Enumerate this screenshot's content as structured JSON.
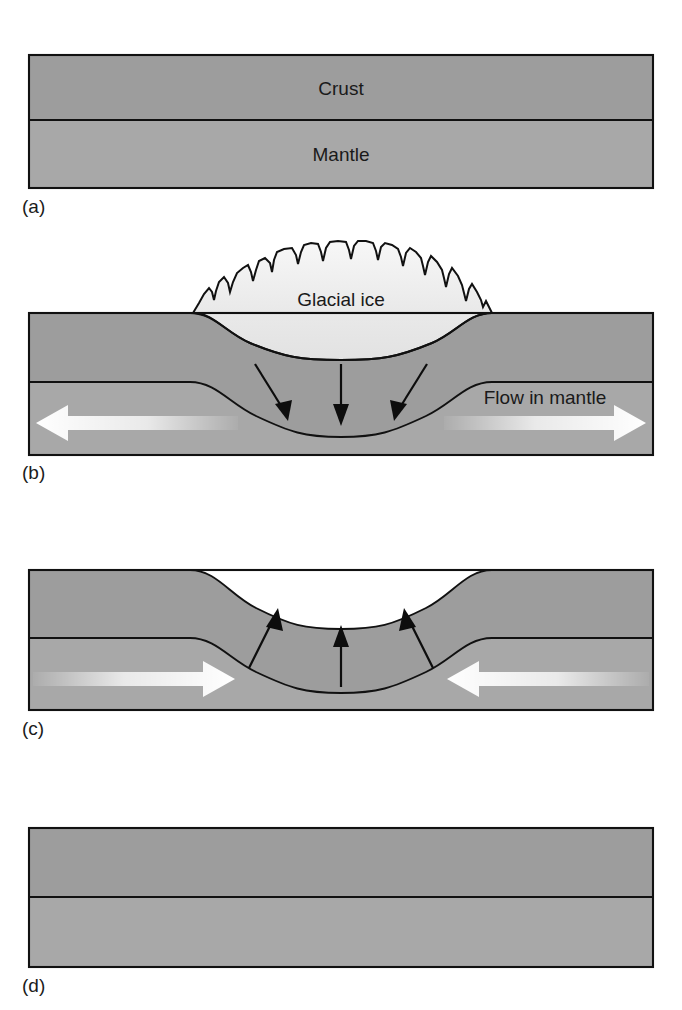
{
  "figure": {
    "background_color": "#ffffff",
    "width": 682,
    "height": 1010
  },
  "colors": {
    "crust_fill": "#9d9d9d",
    "mantle_fill": "#a8a8a8",
    "ice_fill": "#ececec",
    "outline": "#111111",
    "text": "#1a1a1a",
    "white_arrow": "#ffffff"
  },
  "panels": [
    {
      "id": "a",
      "label": "(a)",
      "caption_state": "undisturbed crust and mantle, flat layers",
      "layers": [
        {
          "name": "crust",
          "label": "Crust"
        },
        {
          "name": "mantle",
          "label": "Mantle"
        }
      ],
      "ice_present": false,
      "arrows": []
    },
    {
      "id": "b",
      "label": "(b)",
      "caption_state": "ice sheet loads the crust, crust depresses, mantle flows outward",
      "layers": [
        {
          "name": "crust",
          "label": ""
        },
        {
          "name": "mantle",
          "label": ""
        }
      ],
      "ice_present": true,
      "ice_label": "Glacial ice",
      "flow_label": "Flow in mantle",
      "arrows": [
        {
          "name": "load-arrow-left",
          "kind": "black",
          "direction": "down-right"
        },
        {
          "name": "load-arrow-center",
          "kind": "black",
          "direction": "down"
        },
        {
          "name": "load-arrow-right",
          "kind": "black",
          "direction": "down-left"
        },
        {
          "name": "mantle-flow-arrow-left",
          "kind": "white",
          "direction": "left"
        },
        {
          "name": "mantle-flow-arrow-right",
          "kind": "white",
          "direction": "right"
        }
      ]
    },
    {
      "id": "c",
      "label": "(c)",
      "caption_state": "ice removed, crust rebounds upward, mantle flows back inward",
      "layers": [
        {
          "name": "crust",
          "label": ""
        },
        {
          "name": "mantle",
          "label": ""
        }
      ],
      "ice_present": false,
      "arrows": [
        {
          "name": "rebound-arrow-left",
          "kind": "black",
          "direction": "up-right"
        },
        {
          "name": "rebound-arrow-center",
          "kind": "black",
          "direction": "up"
        },
        {
          "name": "rebound-arrow-right",
          "kind": "black",
          "direction": "up-left"
        },
        {
          "name": "mantle-return-arrow-left",
          "kind": "white",
          "direction": "right"
        },
        {
          "name": "mantle-return-arrow-right",
          "kind": "white",
          "direction": "left"
        }
      ]
    },
    {
      "id": "d",
      "label": "(d)",
      "caption_state": "full rebound complete, layers flat again",
      "layers": [
        {
          "name": "crust",
          "label": ""
        },
        {
          "name": "mantle",
          "label": ""
        }
      ],
      "ice_present": false,
      "arrows": []
    }
  ],
  "labels": {
    "crust": "Crust",
    "mantle": "Mantle",
    "glacial_ice": "Glacial ice",
    "flow_in_mantle": "Flow in mantle",
    "panel_a": "(a)",
    "panel_b": "(b)",
    "panel_c": "(c)",
    "panel_d": "(d)"
  }
}
